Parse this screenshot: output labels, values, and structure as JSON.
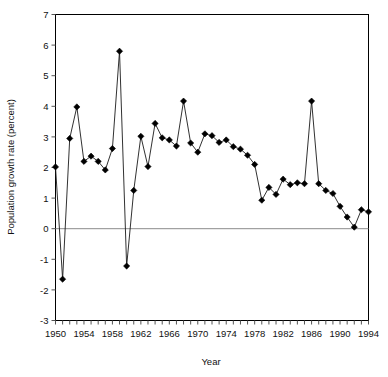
{
  "chart_data": {
    "type": "line",
    "title": "",
    "xlabel": "Year",
    "ylabel": "Population growth rate (percent)",
    "xlim": [
      1950,
      1994
    ],
    "ylim": [
      -3,
      7
    ],
    "ytick_step": 1,
    "yticks": [
      7,
      6,
      5,
      4,
      3,
      2,
      1,
      0,
      -1,
      -2,
      -3
    ],
    "ytick_labels": [
      "7",
      "6",
      "5",
      "4",
      "3",
      "2",
      "1",
      "0",
      "-1",
      "-2",
      "-3"
    ],
    "xtick_step": 1,
    "xtick_label_step": 4,
    "xtick_labels": [
      "1950",
      "1954",
      "1958",
      "1962",
      "1966",
      "1970",
      "1974",
      "1978",
      "1982",
      "1986",
      "1990",
      "1994"
    ],
    "xtick_label_values": [
      1950,
      1954,
      1958,
      1962,
      1966,
      1970,
      1974,
      1978,
      1982,
      1986,
      1990,
      1994
    ],
    "grid": false,
    "legend": null,
    "zero_line": 0,
    "marker": "diamond",
    "marker_color": "#000000",
    "line_color": "#1a1a1a",
    "frame_color": "#000000",
    "zero_line_color": "#8c8c8c",
    "x": [
      1950,
      1951,
      1952,
      1953,
      1954,
      1955,
      1956,
      1957,
      1958,
      1959,
      1960,
      1961,
      1962,
      1963,
      1964,
      1965,
      1966,
      1967,
      1968,
      1969,
      1970,
      1971,
      1972,
      1973,
      1974,
      1975,
      1976,
      1977,
      1978,
      1979,
      1980,
      1981,
      1982,
      1983,
      1984,
      1985,
      1986,
      1987,
      1988,
      1989,
      1990,
      1991,
      1992,
      1993,
      1994
    ],
    "values": [
      2.02,
      -1.65,
      2.95,
      3.98,
      2.2,
      2.37,
      2.2,
      1.92,
      2.62,
      5.8,
      -1.22,
      1.25,
      3.02,
      2.03,
      3.44,
      2.97,
      2.9,
      2.7,
      4.17,
      2.8,
      2.5,
      3.1,
      3.04,
      2.82,
      2.9,
      2.68,
      2.6,
      2.4,
      2.1,
      0.93,
      1.35,
      1.12,
      1.62,
      1.44,
      1.5,
      1.47,
      4.17,
      1.47,
      1.25,
      1.15,
      0.73,
      0.38,
      0.05,
      0.62,
      0.55
    ],
    "series_name": "Population growth rate"
  },
  "axes": {
    "x_title": "Year",
    "y_title": "Population growth rate (percent)"
  }
}
